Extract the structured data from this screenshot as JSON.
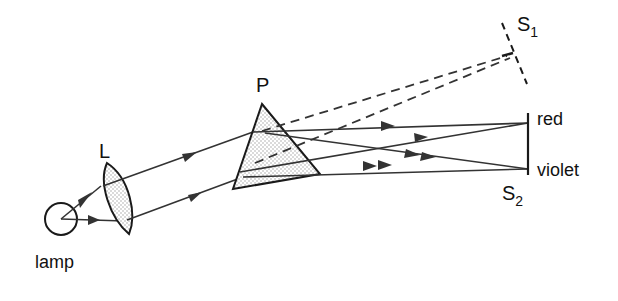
{
  "labels": {
    "lamp": "lamp",
    "lens": "L",
    "prism": "P",
    "screen1": "S",
    "screen1_sub": "1",
    "screen2": "S",
    "screen2_sub": "2",
    "red": "red",
    "violet": "violet"
  },
  "colors": {
    "ink": "#1a1a1a",
    "background": "#ffffff",
    "stipple": "#bdbdbd"
  }
}
